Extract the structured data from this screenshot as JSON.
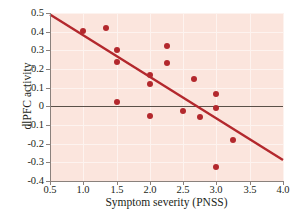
{
  "chart_data": {
    "type": "scatter",
    "title": "",
    "xlabel": "Symptom severity (PNSS)",
    "ylabel": "dlPFC activity",
    "xlim": [
      0.5,
      4.0
    ],
    "ylim": [
      -0.4,
      0.5
    ],
    "xticks": [
      "0.5",
      "1.0",
      "1.5",
      "2.0",
      "2.5",
      "3.0",
      "3.5",
      "4.0"
    ],
    "xtick_values": [
      0.5,
      1.0,
      1.5,
      2.0,
      2.5,
      3.0,
      3.5,
      4.0
    ],
    "yticks": [
      "0.5",
      "0.4",
      "0.3",
      "0.2",
      "0.1",
      "0",
      "-0.1",
      "-0.2",
      "-0.3",
      "-0.4"
    ],
    "ytick_values": [
      0.5,
      0.4,
      0.3,
      0.2,
      0.1,
      0,
      -0.1,
      -0.2,
      -0.3,
      -0.4
    ],
    "grid": true,
    "legend": "none",
    "point_color": "#b3282d",
    "line_color": "#b3282d",
    "plot_background": "#fbe5dd",
    "gridline_color": "#fdf3ef",
    "zero_line_color": "#5a5048",
    "axis_color": "#8a817c",
    "points": [
      {
        "x": 1.0,
        "y": 0.405
      },
      {
        "x": 1.34,
        "y": 0.42
      },
      {
        "x": 1.5,
        "y": 0.3
      },
      {
        "x": 1.5,
        "y": 0.235
      },
      {
        "x": 1.5,
        "y": 0.022
      },
      {
        "x": 2.0,
        "y": 0.17
      },
      {
        "x": 2.0,
        "y": 0.122
      },
      {
        "x": 2.0,
        "y": -0.052
      },
      {
        "x": 2.25,
        "y": 0.322
      },
      {
        "x": 2.25,
        "y": 0.231
      },
      {
        "x": 2.5,
        "y": -0.024
      },
      {
        "x": 2.67,
        "y": 0.145
      },
      {
        "x": 2.75,
        "y": -0.057
      },
      {
        "x": 3.0,
        "y": 0.065
      },
      {
        "x": 3.0,
        "y": -0.01
      },
      {
        "x": 3.0,
        "y": -0.325
      },
      {
        "x": 3.25,
        "y": -0.178
      }
    ],
    "regression_line": {
      "x_start": 0.5,
      "y_start": 0.492,
      "x_end": 4.0,
      "y_end": -0.287
    },
    "zero_reference_line": {
      "y": 0
    }
  }
}
